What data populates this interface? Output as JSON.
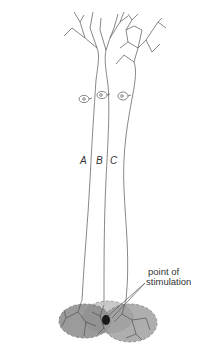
{
  "diagram": {
    "title": "",
    "neuron_labels": [
      "A",
      "B",
      "C"
    ],
    "callout": {
      "line1": "point of",
      "line2": "stimulation"
    },
    "colors": {
      "line": "#555555",
      "field_fill": "#8a8a8a",
      "field_edge": "#6a6a6a",
      "stim_point": "#1a1a1a"
    }
  }
}
